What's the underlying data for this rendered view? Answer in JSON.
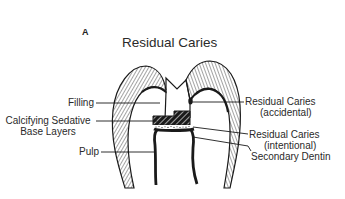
{
  "figure": {
    "letter": "A",
    "title": "Residual Caries"
  },
  "labels": {
    "left": [
      {
        "id": "filling",
        "text": "Filling"
      },
      {
        "id": "base-layers",
        "line1": "Calcifying Sedative",
        "line2": "Base Layers"
      },
      {
        "id": "pulp",
        "text": "Pulp"
      }
    ],
    "right": [
      {
        "id": "residual-accidental",
        "line1": "Residual Caries",
        "line2": "(accidental)"
      },
      {
        "id": "residual-intentional",
        "line1": "Residual Caries",
        "line2": "(intentional)"
      },
      {
        "id": "secondary-dentin",
        "text": "Secondary Dentin"
      }
    ]
  },
  "colors": {
    "ink": "#1a1a1a",
    "background": "#ffffff"
  }
}
